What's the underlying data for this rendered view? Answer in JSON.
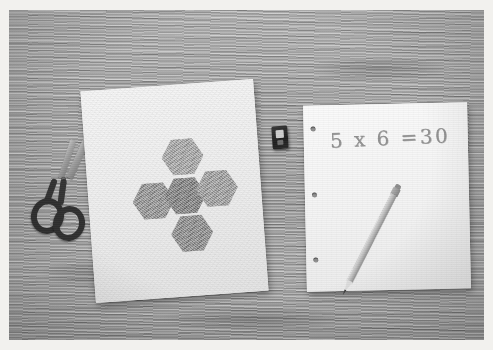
{
  "scene": {
    "title": "Math manipulatives photo",
    "description": "Overhead grayscale photo of a wooden desk with craft supplies used for a multiplication lesson",
    "width": 493,
    "height": 350,
    "border_color": "#ffffff",
    "surface": {
      "name": "wooden desk surface",
      "material": "wood grain",
      "color": "#a3a3a1"
    }
  },
  "objects": {
    "craft_sheet": {
      "name": "construction paper with hexagons",
      "color": "#f1f0ed",
      "rotation_deg": -4.2
    },
    "work_sheet": {
      "name": "loose-leaf binder paper",
      "color": "#f4f3f1",
      "rotation_deg": -1.2,
      "hole_count": 3
    },
    "equation": {
      "text": "5 x 6 =30",
      "written_in": "pencil",
      "ink_color": "#8a8a88"
    },
    "hexagons": {
      "label": "shaded hexagon cutouts",
      "count": 5,
      "arrangement": "plus / cross",
      "items": [
        {
          "name": "hexagon-top",
          "position": "top",
          "shade": "#a8a8a6",
          "left": 76,
          "top": 54
        },
        {
          "name": "hexagon-left",
          "position": "left",
          "shade": "#949492",
          "left": 44,
          "top": 96
        },
        {
          "name": "hexagon-center",
          "position": "center",
          "shade": "#7f7f7d",
          "left": 76,
          "top": 93
        },
        {
          "name": "hexagon-right",
          "position": "right",
          "shade": "#a0a09e",
          "left": 108,
          "top": 88
        },
        {
          "name": "hexagon-bottom",
          "position": "bottom",
          "shade": "#8b8b89",
          "left": 80,
          "top": 131
        }
      ]
    },
    "scissors": {
      "name": "scissors",
      "handle_color": "#2f2f2e",
      "blade_color": "#a6a6a4",
      "orientation": "diagonal, tips up-right"
    },
    "pencil": {
      "name": "pencil",
      "body_color": "#c3c2bf",
      "lead_color": "#3a3a39",
      "rotation_deg": 27
    },
    "sharpener": {
      "name": "pencil sharpener",
      "body_color": "#262625"
    }
  }
}
